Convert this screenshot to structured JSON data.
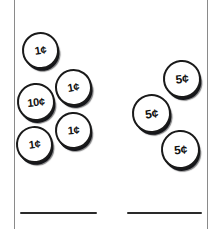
{
  "worksheet": {
    "title": "Counting coins worksheet",
    "width": 213,
    "height": 229,
    "background": "#ffffff",
    "rule_color": "#8a8a8a",
    "ink_color": "#111111"
  },
  "rules": [
    {
      "name": "left-rule",
      "x": 14
    },
    {
      "name": "right-rule",
      "x": 207
    }
  ],
  "groups": [
    {
      "name": "left-coin-group",
      "description": "Four pennies and one dime",
      "total_cents": 14,
      "coins": [
        {
          "label": "1¢",
          "type": "penny",
          "x": 22,
          "y": 32,
          "size": 37,
          "rotate": -8
        },
        {
          "label": "1¢",
          "type": "penny",
          "x": 55,
          "y": 69,
          "size": 37,
          "rotate": -10
        },
        {
          "label": "10¢",
          "type": "dime",
          "x": 17,
          "y": 83,
          "size": 38,
          "rotate": -6
        },
        {
          "label": "1¢",
          "type": "penny",
          "x": 55,
          "y": 112,
          "size": 37,
          "rotate": -4
        },
        {
          "label": "1¢",
          "type": "penny",
          "x": 16,
          "y": 126,
          "size": 37,
          "rotate": -7
        }
      ],
      "answer_line": {
        "x": 20,
        "y": 212,
        "width": 77
      }
    },
    {
      "name": "right-coin-group",
      "description": "Three nickels",
      "total_cents": 15,
      "coins": [
        {
          "label": "5¢",
          "type": "nickel",
          "x": 163,
          "y": 60,
          "size": 38,
          "rotate": -6
        },
        {
          "label": "5¢",
          "type": "nickel",
          "x": 132,
          "y": 94,
          "size": 39,
          "rotate": -8
        },
        {
          "label": "5¢",
          "type": "nickel",
          "x": 161,
          "y": 130,
          "size": 39,
          "rotate": -5
        }
      ],
      "answer_line": {
        "x": 127,
        "y": 212,
        "width": 75
      }
    }
  ]
}
